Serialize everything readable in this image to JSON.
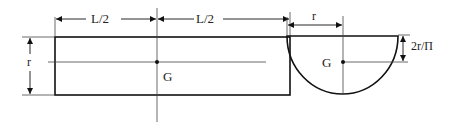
{
  "diagram": {
    "colors": {
      "ink": "#111111",
      "thin": "#444444",
      "text": "#222222",
      "background": "#ffffff"
    },
    "rectangle_view": {
      "dimension_left_half": "L/2",
      "dimension_right_half": "L/2",
      "dimension_height": "r",
      "centroid_label": "G"
    },
    "semicircle_view": {
      "dimension_radius": "r",
      "dimension_centroid_offset": "2r/Π",
      "centroid_label": "G"
    }
  }
}
